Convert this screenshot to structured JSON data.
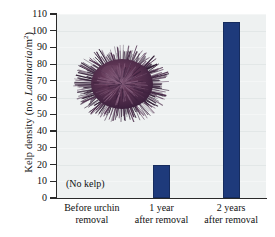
{
  "chart_data": {
    "type": "bar",
    "title": "",
    "xlabel": "",
    "ylabel": "Kelp density (no. Laminaria/m2)",
    "ylabel_parts": {
      "prefix": "Kelp density (no. ",
      "italic": "Laminaria",
      "middle": "/m",
      "exponent": "2",
      "suffix": ")"
    },
    "categories": [
      "Before urchin removal",
      "1 year after removal",
      "2 years after removal"
    ],
    "category_lines": [
      [
        "Before urchin",
        "removal"
      ],
      [
        "1 year",
        "after removal"
      ],
      [
        "2 years",
        "after removal"
      ]
    ],
    "values": [
      0,
      20,
      105
    ],
    "ylim": [
      0,
      110
    ],
    "yticks": [
      0,
      10,
      20,
      30,
      40,
      50,
      60,
      70,
      80,
      90,
      100,
      110
    ],
    "ytick_labels": [
      "0",
      "10",
      "20",
      "30",
      "40",
      "50",
      "60",
      "70",
      "80",
      "90",
      "100",
      "110"
    ],
    "grid": true,
    "legend": "none",
    "annotations": [
      {
        "text": "(No kelp)",
        "category": "Before urchin removal",
        "note": "placed inside plot near the zero-value first category"
      },
      {
        "text": "sea urchin photograph",
        "note": "inset photo of a purple sea urchin over the plot area"
      }
    ],
    "colors": {
      "bar": "#1e3a7b",
      "bar_edge": "#162c5e",
      "plot_background": "#eef1f1",
      "gridline": "#e2e7e7",
      "axis": "#2a2a2a",
      "figure_background": "#ffffff",
      "urchin_body": "#56304f",
      "urchin_spines": "#3d2240",
      "urchin_highlight": "#8a6381"
    }
  },
  "annotation_text": {
    "no_kelp": "(No kelp)"
  },
  "figure": {
    "inset_image_name": "sea-urchin-photo"
  }
}
